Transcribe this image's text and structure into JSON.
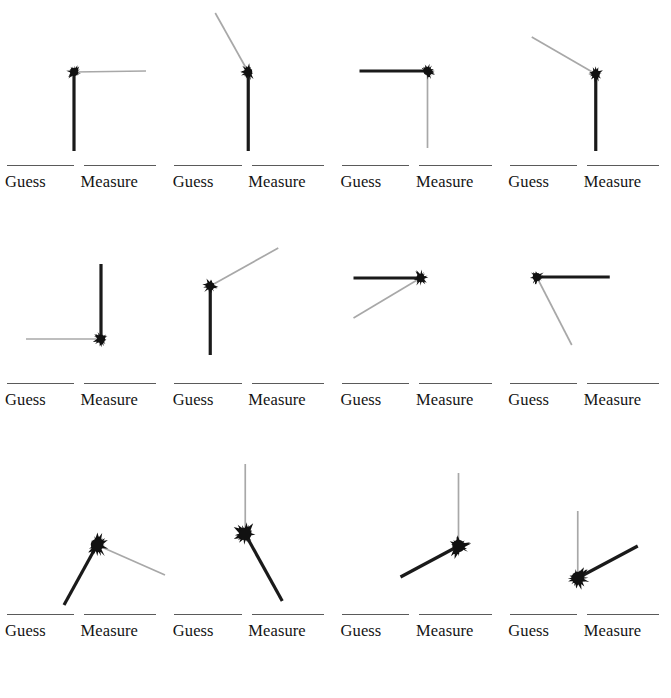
{
  "figure": {
    "width": 671,
    "height": 698,
    "background": "#ffffff",
    "grid": {
      "rows": 3,
      "columns": 4
    },
    "legend": {
      "guess_label": "Guess",
      "measure_label": "Measure",
      "rule_color": "#5a5a5a",
      "label_color": "#141414"
    },
    "series": {
      "guess": {
        "name": "Guess",
        "color": "#1a1a1a",
        "stroke_width": 3.2
      },
      "measure": {
        "name": "Measure",
        "color": "#a8a8a8",
        "stroke_width": 1.7
      }
    },
    "marker": {
      "name": "star-burst-marker",
      "color": "#111111"
    }
  },
  "chart_data": {
    "type": "scatter",
    "title": "",
    "xlabel": "",
    "ylabel": "",
    "grid": false,
    "legend_position": "below-each-panel",
    "series_names": [
      "Guess",
      "Measure"
    ],
    "panels": [
      {
        "index": 1,
        "row": 1,
        "col": 1,
        "origin": [
          74,
          72
        ],
        "guess": {
          "angle_deg": -90,
          "length": 79,
          "end": [
            74,
            151
          ]
        },
        "measure": {
          "angle_deg": 0,
          "length": 72,
          "end": [
            146,
            71
          ]
        }
      },
      {
        "index": 2,
        "row": 1,
        "col": 2,
        "origin": [
          248,
          72
        ],
        "guess": {
          "angle_deg": -90,
          "length": 79,
          "end": [
            248,
            151
          ]
        },
        "measure": {
          "angle_deg": 119,
          "length": 68,
          "end": [
            215,
            13
          ]
        }
      },
      {
        "index": 3,
        "row": 1,
        "col": 3,
        "origin": [
          427,
          71
        ],
        "guess": {
          "angle_deg": 180,
          "length": 68,
          "end": [
            359,
            71
          ]
        },
        "measure": {
          "angle_deg": -90,
          "length": 77,
          "end": [
            427,
            148
          ]
        }
      },
      {
        "index": 4,
        "row": 1,
        "col": 4,
        "origin": [
          596,
          74
        ],
        "guess": {
          "angle_deg": -90,
          "length": 77,
          "end": [
            596,
            151
          ]
        },
        "measure": {
          "angle_deg": 150,
          "length": 74,
          "end": [
            532,
            37
          ]
        }
      },
      {
        "index": 5,
        "row": 2,
        "col": 1,
        "origin": [
          101,
          339
        ],
        "guess": {
          "angle_deg": 90,
          "length": 75,
          "end": [
            101,
            264
          ]
        },
        "measure": {
          "angle_deg": 180,
          "length": 75,
          "end": [
            26,
            339
          ]
        }
      },
      {
        "index": 6,
        "row": 2,
        "col": 2,
        "origin": [
          210,
          286
        ],
        "guess": {
          "angle_deg": -90,
          "length": 69,
          "end": [
            210,
            355
          ]
        },
        "measure": {
          "angle_deg": 29,
          "length": 78,
          "end": [
            278,
            248
          ]
        }
      },
      {
        "index": 7,
        "row": 2,
        "col": 3,
        "origin": [
          420,
          278
        ],
        "guess": {
          "angle_deg": 180,
          "length": 67,
          "end": [
            353,
            278
          ]
        },
        "measure": {
          "angle_deg": 211,
          "length": 78,
          "end": [
            353,
            318
          ]
        }
      },
      {
        "index": 8,
        "row": 2,
        "col": 4,
        "origin": [
          537,
          277
        ],
        "guess": {
          "angle_deg": 0,
          "length": 73,
          "end": [
            610,
            277
          ]
        },
        "measure": {
          "angle_deg": -63,
          "length": 76,
          "end": [
            572,
            345
          ]
        }
      },
      {
        "index": 9,
        "row": 3,
        "col": 1,
        "origin": [
          97,
          545
        ],
        "guess": {
          "angle_deg": 241,
          "length": 68,
          "end": [
            64,
            605
          ]
        },
        "measure": {
          "angle_deg": -24,
          "length": 74,
          "end": [
            165,
            575
          ]
        }
      },
      {
        "index": 10,
        "row": 3,
        "col": 2,
        "origin": [
          245,
          534
        ],
        "guess": {
          "angle_deg": -61,
          "length": 76,
          "end": [
            282,
            601
          ]
        },
        "measure": {
          "angle_deg": 90,
          "length": 70,
          "end": [
            245,
            464
          ]
        }
      },
      {
        "index": 11,
        "row": 3,
        "col": 3,
        "origin": [
          458,
          546
        ],
        "guess": {
          "angle_deg": 208,
          "length": 66,
          "end": [
            400,
            577
          ]
        },
        "measure": {
          "angle_deg": 90,
          "length": 73,
          "end": [
            458,
            473
          ]
        }
      },
      {
        "index": 12,
        "row": 3,
        "col": 4,
        "origin": [
          578,
          578
        ],
        "guess": {
          "angle_deg": 28,
          "length": 68,
          "end": [
            638,
            546
          ]
        },
        "measure": {
          "angle_deg": 90,
          "length": 67,
          "end": [
            578,
            511
          ]
        }
      }
    ]
  }
}
